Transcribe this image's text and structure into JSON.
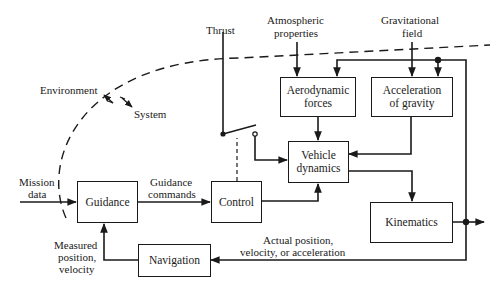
{
  "diagram": {
    "type": "block-diagram",
    "blocks": {
      "guidance": "Guidance",
      "control": "Control",
      "navigation": "Navigation",
      "aerodynamic_forces": "Aerodynamic forces",
      "acceleration_of_gravity": "Acceleration of gravity",
      "vehicle_dynamics": "Vehicle dynamics",
      "kinematics": "Kinematics"
    },
    "labels": {
      "thrust": "Thrust",
      "atmospheric_1": "Atmospheric",
      "atmospheric_2": "properties",
      "gravitational_1": "Gravitational",
      "gravitational_2": "field",
      "environment": "Environment",
      "system": "System",
      "mission_1": "Mission",
      "mission_2": "data",
      "guidance_cmd_1": "Guidance",
      "guidance_cmd_2": "commands",
      "measured_1": "Measured",
      "measured_2": "position,",
      "measured_3": "velocity",
      "actual_1": "Actual position,",
      "actual_2": "velocity, or acceleration"
    },
    "connections": [
      {
        "from": "Mission data",
        "to": "Guidance"
      },
      {
        "from": "Guidance",
        "to": "Control",
        "label": "Guidance commands"
      },
      {
        "from": "Control",
        "to": "Vehicle dynamics"
      },
      {
        "from": "Control",
        "to": "Thrust switch",
        "style": "dashed"
      },
      {
        "from": "Thrust",
        "to": "Vehicle dynamics",
        "via": "switch"
      },
      {
        "from": "Atmospheric properties",
        "to": "Aerodynamic forces"
      },
      {
        "from": "Gravitational field",
        "to": "Acceleration of gravity"
      },
      {
        "from": "Aerodynamic forces",
        "to": "Vehicle dynamics"
      },
      {
        "from": "Acceleration of gravity",
        "to": "Vehicle dynamics"
      },
      {
        "from": "Vehicle dynamics",
        "to": "Kinematics"
      },
      {
        "from": "Kinematics",
        "to": "Aerodynamic forces",
        "via": "feedback bus"
      },
      {
        "from": "Kinematics",
        "to": "Acceleration of gravity",
        "via": "feedback bus"
      },
      {
        "from": "Kinematics",
        "to": "Navigation",
        "label": "Actual position, velocity, or acceleration"
      },
      {
        "from": "Navigation",
        "to": "Guidance",
        "label": "Measured position, velocity"
      },
      {
        "from": "Kinematics",
        "to": "output"
      }
    ],
    "boundary": {
      "style": "dashed",
      "outside": "Environment",
      "inside": "System"
    }
  }
}
